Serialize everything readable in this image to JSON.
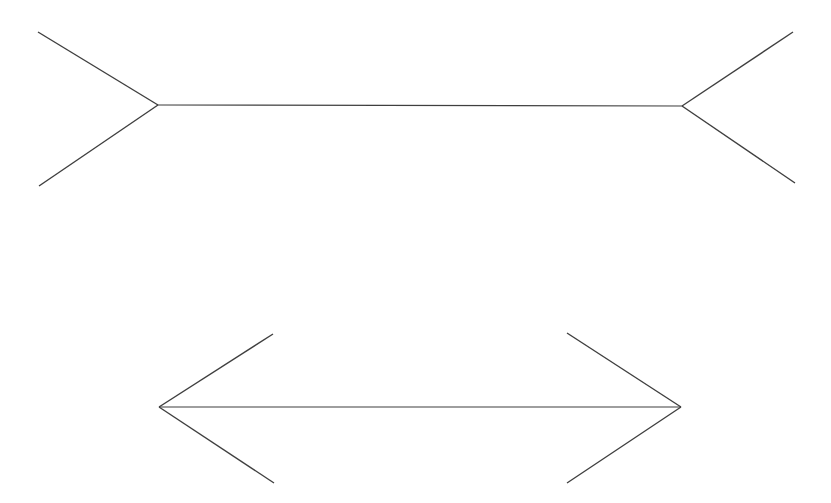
{
  "canvas": {
    "width": 831,
    "height": 503,
    "background_color": "#ffffff"
  },
  "style": {
    "line_color": "#3f3f3f",
    "line_width": 1.4,
    "line_width_shaft": 1.2
  },
  "figures": [
    {
      "id": "top-figure",
      "name": "muller-lyer-outward-fins",
      "description": "Horizontal shaft with outward-pointing (arrow-tail) fins at both ends",
      "fin_direction": "outward",
      "shaft": {
        "x1": 158,
        "y1": 105,
        "x2": 682,
        "y2": 106
      },
      "fins": [
        {
          "name": "left-upper-fin",
          "x1": 158,
          "y1": 105,
          "x2": 38,
          "y2": 32
        },
        {
          "name": "left-lower-fin",
          "x1": 158,
          "y1": 105,
          "x2": 39,
          "y2": 186
        },
        {
          "name": "right-upper-fin",
          "x1": 682,
          "y1": 106,
          "x2": 793,
          "y2": 32
        },
        {
          "name": "right-lower-fin",
          "x1": 682,
          "y1": 106,
          "x2": 795,
          "y2": 183
        }
      ]
    },
    {
      "id": "bottom-figure",
      "name": "muller-lyer-inward-fins",
      "description": "Horizontal shaft with inward-pointing (arrow-head) fins at both ends",
      "fin_direction": "inward",
      "shaft": {
        "x1": 159,
        "y1": 407,
        "x2": 681,
        "y2": 407
      },
      "fins": [
        {
          "name": "left-upper-fin",
          "x1": 159,
          "y1": 407,
          "x2": 273,
          "y2": 334
        },
        {
          "name": "left-lower-fin",
          "x1": 159,
          "y1": 407,
          "x2": 274,
          "y2": 483
        },
        {
          "name": "right-upper-fin",
          "x1": 681,
          "y1": 407,
          "x2": 567,
          "y2": 333
        },
        {
          "name": "right-lower-fin",
          "x1": 681,
          "y1": 407,
          "x2": 567,
          "y2": 483
        }
      ]
    }
  ]
}
